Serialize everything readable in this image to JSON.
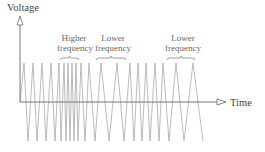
{
  "diagram": {
    "y_axis_label": "Voltage",
    "x_axis_label": "Time",
    "annotations": [
      {
        "line1": "Higher",
        "line2": "frequency",
        "brace_from": 60,
        "brace_to": 79
      },
      {
        "line1": "Lower",
        "line2": "frequency",
        "brace_from": 96,
        "brace_to": 126
      },
      {
        "line1": "Lower",
        "line2": "frequency",
        "brace_from": 167,
        "brace_to": 195
      }
    ],
    "colors": {
      "axis": "#777777",
      "wave": "#aaaaaa",
      "text": "#555555"
    },
    "geometry": {
      "axis_x": 20,
      "axis_y": 102,
      "axis_top": 16,
      "axis_right": 226,
      "peak_y": 63,
      "trough_y": 141
    },
    "wave_peaks_x": [
      24,
      33,
      42,
      51,
      59,
      64,
      68,
      72,
      76,
      81,
      89,
      101,
      117,
      130,
      138,
      146,
      155,
      163,
      176,
      193
    ],
    "wave_troughs_x": [
      28,
      37,
      46,
      55,
      61,
      66,
      70,
      74,
      78,
      85,
      95,
      109,
      124,
      134,
      142,
      150,
      159,
      169,
      184,
      203
    ]
  }
}
